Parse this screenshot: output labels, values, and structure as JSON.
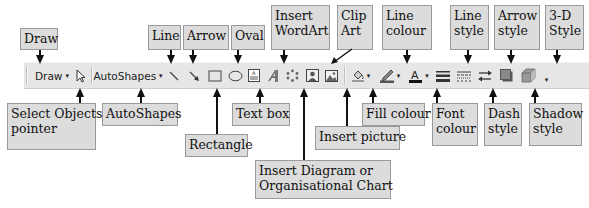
{
  "toolbar": {
    "draw_label": "Draw",
    "autoshapes_label": "AutoShapes",
    "dropdown_glyph": "▾",
    "colors": {
      "background": "#e6e6e6",
      "fill_swatch": "#999999",
      "line_swatch": "#555555",
      "font_swatch": "#111111"
    }
  },
  "callouts": {
    "draw": "Draw",
    "line": "Line",
    "arrow": "Arrow",
    "oval": "Oval",
    "wordart_1": "Insert",
    "wordart_2": "WordArt",
    "clipart_1": "Clip",
    "clipart_2": "Art",
    "line_colour_1": "Line",
    "line_colour_2": "colour",
    "line_style_1": "Line",
    "line_style_2": "style",
    "arrow_style_1": "Arrow",
    "arrow_style_2": "style",
    "threed_1": "3-D",
    "threed_2": "Style",
    "select_1": "Select Objects",
    "select_2": "pointer",
    "autoshapes": "AutoShapes",
    "rectangle": "Rectangle",
    "textbox": "Text box",
    "diagram_1": "Insert Diagram or",
    "diagram_2": "Organisational Chart",
    "picture": "Insert picture",
    "fill_colour": "Fill colour",
    "font_colour_1": "Font",
    "font_colour_2": "colour",
    "dash_1": "Dash",
    "dash_2": "style",
    "shadow_1": "Shadow",
    "shadow_2": "style"
  }
}
